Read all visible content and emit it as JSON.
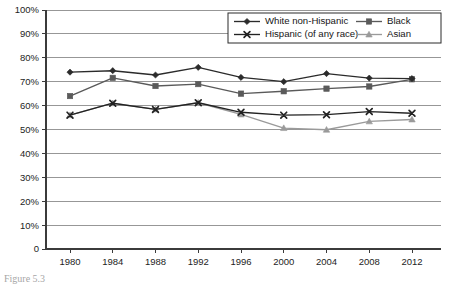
{
  "chart_data": {
    "type": "line",
    "title": "",
    "subtitle": "",
    "xlabel": "",
    "ylabel": "",
    "x": [
      1980,
      1984,
      1988,
      1992,
      1996,
      2000,
      2004,
      2008,
      2012
    ],
    "categories": [
      "1980",
      "1984",
      "1988",
      "1992",
      "1996",
      "2000",
      "2004",
      "2008",
      "2012"
    ],
    "xtick_labels": [
      "1980",
      "1984",
      "1988",
      "1992",
      "1996",
      "2000",
      "2004",
      "2008",
      "2012"
    ],
    "ytick_labels": [
      "0",
      "10%",
      "20%",
      "30%",
      "40%",
      "50%",
      "60%",
      "70%",
      "80%",
      "90%",
      "100%"
    ],
    "ytick_values": [
      0,
      10,
      20,
      30,
      40,
      50,
      60,
      70,
      80,
      90,
      100
    ],
    "ylim": [
      0,
      100
    ],
    "xlim": [
      1980,
      2012
    ],
    "grid": "horizontal",
    "legend_position": "top-right",
    "series": [
      {
        "name": "White non-Hispanic",
        "marker": "diamond",
        "color": "#2b2b2b",
        "values": [
          74.0,
          74.6,
          72.8,
          76.0,
          71.8,
          70.0,
          73.4,
          71.5,
          71.3
        ]
      },
      {
        "name": "Black",
        "marker": "square",
        "color": "#5a5a5a",
        "values": [
          64.0,
          71.6,
          68.2,
          69.0,
          65.0,
          66.0,
          67.1,
          68.0,
          71.0
        ]
      },
      {
        "name": "Hispanic (of any race)",
        "marker": "cross",
        "color": "#222222",
        "values": [
          56.0,
          61.0,
          58.4,
          61.2,
          57.2,
          56.0,
          56.2,
          57.5,
          56.8
        ]
      },
      {
        "name": "Asian",
        "marker": "triangle",
        "color": "#9a9a9a",
        "values": [
          56.0,
          61.0,
          58.4,
          61.2,
          56.3,
          50.6,
          49.9,
          53.4,
          54.2
        ]
      }
    ]
  },
  "legend": {
    "entries": [
      {
        "label": "White non-Hispanic",
        "marker": "diamond",
        "color": "#2b2b2b"
      },
      {
        "label": "Black",
        "marker": "square",
        "color": "#5a5a5a"
      },
      {
        "label": "Hispanic (of any race)",
        "marker": "cross",
        "color": "#222222"
      },
      {
        "label": "Asian",
        "marker": "triangle",
        "color": "#9a9a9a"
      }
    ]
  },
  "caption": {
    "text": "Figure 5.3"
  }
}
